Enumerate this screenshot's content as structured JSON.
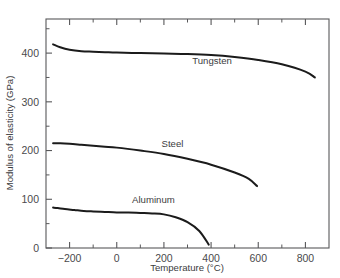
{
  "chart_data": {
    "type": "line",
    "title": "",
    "xlabel": "Temperature (°C)",
    "ylabel": "Modulus of elasticity (GPa)",
    "xlim": [
      -300,
      900
    ],
    "ylim": [
      0,
      470
    ],
    "grid": false,
    "legend_position": "inline-labels",
    "xticks": [
      -200,
      0,
      200,
      400,
      600,
      800
    ],
    "xtick_labels": [
      "−200",
      "0",
      "200",
      "400",
      "600",
      "800"
    ],
    "xminor_ticks": [
      -300,
      -100,
      100,
      300,
      500,
      700,
      900
    ],
    "yticks": [
      0,
      100,
      200,
      300,
      400
    ],
    "ytick_labels": [
      "0",
      "100",
      "200",
      "300",
      "400"
    ],
    "yminor_ticks": [
      50,
      150,
      250,
      350,
      450
    ],
    "series": [
      {
        "name": "Tungsten",
        "label": "Tungsten",
        "label_x": 320,
        "label_y": 378,
        "x": [
          -270,
          -240,
          -200,
          -150,
          -100,
          -50,
          0,
          100,
          200,
          300,
          400,
          500,
          600,
          700,
          800,
          840
        ],
        "y": [
          418,
          412,
          407,
          404,
          403,
          402,
          401,
          400,
          399,
          398,
          396,
          392,
          386,
          377,
          362,
          350
        ]
      },
      {
        "name": "Steel",
        "label": "Steel",
        "label_x": 190,
        "label_y": 208,
        "x": [
          -270,
          -240,
          -200,
          -150,
          -100,
          -50,
          0,
          100,
          200,
          300,
          400,
          500,
          560,
          595
        ],
        "y": [
          215,
          215,
          214,
          212,
          210,
          208,
          206,
          200,
          193,
          183,
          171,
          155,
          142,
          127
        ]
      },
      {
        "name": "Aluminum",
        "label": "Aluminum",
        "label_x": 65,
        "label_y": 92,
        "x": [
          -270,
          -250,
          -220,
          -180,
          -140,
          -100,
          -50,
          0,
          50,
          100,
          150,
          200,
          250,
          300,
          350,
          390
        ],
        "y": [
          83,
          82,
          80,
          78,
          76,
          75,
          74,
          73,
          73,
          72,
          71,
          69,
          63,
          53,
          35,
          7
        ]
      }
    ]
  }
}
